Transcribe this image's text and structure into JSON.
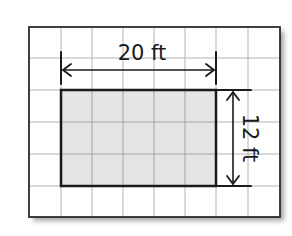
{
  "diagram": {
    "type": "area-rectangle-on-grid",
    "grid": {
      "columns": 8,
      "rows": 6,
      "line_color": "#b0b0b0",
      "border_color": "#2a2a2a",
      "background": "#ffffff"
    },
    "rectangle": {
      "grid_cols": 5,
      "grid_rows": 3,
      "fill": "#e3e3e3",
      "stroke": "#1a1a1a"
    },
    "dimensions": {
      "width": {
        "label": "20 ft",
        "value": 20,
        "unit": "ft"
      },
      "height": {
        "label": "12 ft",
        "value": 12,
        "unit": "ft"
      }
    }
  }
}
